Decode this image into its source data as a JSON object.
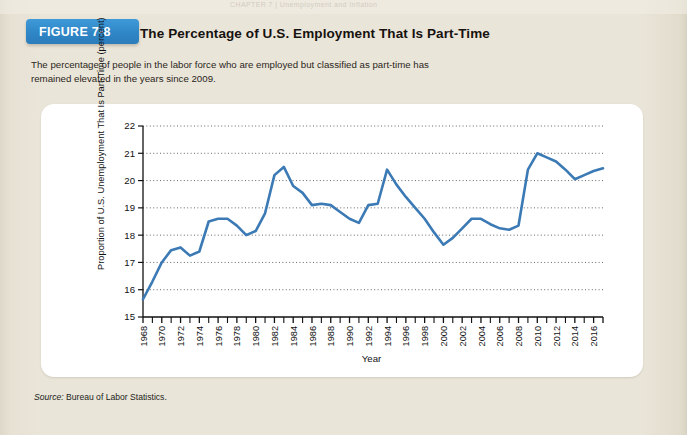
{
  "page": {
    "running_head": "CHAPTER 7   |   Unemployment and Inflation",
    "background_color": "#eae5d9",
    "card_color": "#ffffff"
  },
  "figure": {
    "badge_label": "FIGURE 7-8",
    "badge_color": "#2f86c6",
    "title": "The Percentage of U.S. Employment That Is Part-Time",
    "description": "The percentage of people in the labor force who are employed but classified as part-time has remained elevated in the years since 2009.",
    "source_prefix": "Source:",
    "source_text": " Bureau of Labor Statistics."
  },
  "chart_data": {
    "type": "line",
    "title": "The Percentage of U.S. Employment That Is Part-Time",
    "xlabel": "Year",
    "ylabel": "Proportion of U.S. Unemployment That Is Part-Time (percent)",
    "line_color": "#3b7ab5",
    "grid": true,
    "grid_style": "dotted-horizontal",
    "legend": "none",
    "xlim": [
      1968,
      2017
    ],
    "ylim": [
      15,
      22
    ],
    "yticks": [
      15,
      16,
      17,
      18,
      19,
      20,
      21,
      22
    ],
    "xticks": [
      1968,
      1970,
      1972,
      1974,
      1976,
      1978,
      1980,
      1982,
      1984,
      1986,
      1988,
      1990,
      1992,
      1994,
      1996,
      1998,
      2000,
      2002,
      2004,
      2006,
      2008,
      2010,
      2012,
      2014,
      2016
    ],
    "minor_xtick_interval": 1,
    "x": [
      1968,
      1969,
      1970,
      1971,
      1972,
      1973,
      1974,
      1975,
      1976,
      1977,
      1978,
      1979,
      1980,
      1981,
      1982,
      1983,
      1984,
      1985,
      1986,
      1987,
      1988,
      1989,
      1990,
      1991,
      1992,
      1993,
      1994,
      1995,
      1996,
      1997,
      1998,
      1999,
      2000,
      2001,
      2002,
      2003,
      2004,
      2005,
      2006,
      2007,
      2008,
      2009,
      2010,
      2011,
      2012,
      2013,
      2014,
      2015,
      2016,
      2017
    ],
    "values": [
      15.65,
      16.3,
      17.0,
      17.45,
      17.55,
      17.25,
      17.4,
      18.5,
      18.6,
      18.6,
      18.35,
      18.0,
      18.15,
      18.8,
      20.2,
      20.5,
      19.8,
      19.55,
      19.1,
      19.15,
      19.1,
      18.85,
      18.6,
      18.45,
      19.1,
      19.15,
      20.4,
      19.85,
      19.4,
      19.0,
      18.6,
      18.1,
      17.65,
      17.9,
      18.25,
      18.6,
      18.6,
      18.4,
      18.25,
      18.2,
      18.35,
      20.4,
      21.0,
      20.85,
      20.7,
      20.4,
      20.05,
      20.2,
      20.35,
      20.45
    ],
    "series_name": "Part-time share of U.S. employment",
    "units": "percent"
  }
}
